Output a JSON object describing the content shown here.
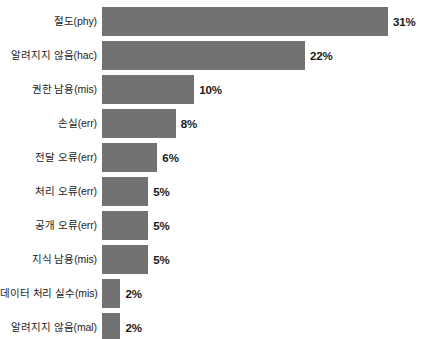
{
  "chart_data": {
    "type": "bar",
    "orientation": "horizontal",
    "title": "",
    "subtitle": "",
    "xlabel": "",
    "ylabel": "",
    "grid": false,
    "legend": null,
    "axis_visible": false,
    "value_suffix": "%",
    "xlim": [
      0,
      31
    ],
    "bar_color": "#727272",
    "label_color": "#1c1c1c",
    "value_color": "#1a1a1a",
    "background": "#ffffff",
    "categories": [
      "절도(phy)",
      "알려지지 않음(hac)",
      "권한 남용(mis)",
      "손실(err)",
      "전달 오류(err)",
      "처리 오류(err)",
      "공개 오류(err)",
      "지식 남용(mis)",
      "데이터 처리 실수(mis)",
      "알려지지 않음(mal)"
    ],
    "values": [
      31,
      22,
      10,
      8,
      6,
      5,
      5,
      5,
      2,
      2
    ],
    "value_labels": [
      "31%",
      "22%",
      "10%",
      "8%",
      "6%",
      "5%",
      "5%",
      "5%",
      "2%",
      "2%"
    ],
    "bars": [
      {
        "category": "절도(phy)",
        "value": 31,
        "value_label": "31%"
      },
      {
        "category": "알려지지 않음(hac)",
        "value": 22,
        "value_label": "22%"
      },
      {
        "category": "권한 남용(mis)",
        "value": 10,
        "value_label": "10%"
      },
      {
        "category": "손실(err)",
        "value": 8,
        "value_label": "8%"
      },
      {
        "category": "전달 오류(err)",
        "value": 6,
        "value_label": "6%"
      },
      {
        "category": "처리 오류(err)",
        "value": 5,
        "value_label": "5%"
      },
      {
        "category": "공개 오류(err)",
        "value": 5,
        "value_label": "5%"
      },
      {
        "category": "지식 남용(mis)",
        "value": 5,
        "value_label": "5%"
      },
      {
        "category": "데이터 처리 실수(mis)",
        "value": 2,
        "value_label": "2%"
      },
      {
        "category": "알려지지 않음(mal)",
        "value": 2,
        "value_label": "2%"
      }
    ]
  }
}
